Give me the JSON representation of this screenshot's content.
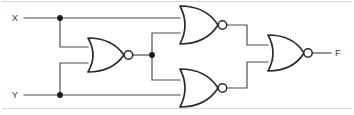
{
  "diagram": {
    "type": "logic-circuit",
    "colors": {
      "background": "#ffffff",
      "wire": "#4a4a4a",
      "gate_outline": "#2b2b2b",
      "label_text": "#3d3d3d",
      "junction": "#1a1a1a",
      "frame": "#d8d8d8"
    },
    "inputs": [
      {
        "id": "X",
        "label": "X",
        "x": 15,
        "y": 18
      },
      {
        "id": "Y",
        "label": "Y",
        "x": 15,
        "y": 95
      }
    ],
    "outputs": [
      {
        "id": "F",
        "label": "F",
        "x": 337,
        "y": 53
      }
    ],
    "gates": [
      {
        "id": "g1",
        "type": "NOR",
        "label": "NOR",
        "inputs": [
          "X",
          "Y"
        ],
        "output": "n1",
        "x": 88,
        "y": 55
      },
      {
        "id": "g2",
        "type": "NOR",
        "label": "NOR",
        "inputs": [
          "X",
          "n1"
        ],
        "output": "n2",
        "x": 180,
        "y": 22
      },
      {
        "id": "g3",
        "type": "NOR",
        "label": "NOR",
        "inputs": [
          "n1",
          "Y"
        ],
        "output": "n3",
        "x": 180,
        "y": 90
      },
      {
        "id": "g4",
        "type": "NOR",
        "label": "NOR",
        "inputs": [
          "n2",
          "n3"
        ],
        "output": "F",
        "x": 268,
        "y": 53
      }
    ],
    "junctions": [
      {
        "id": "j-x",
        "on_net": "X",
        "x": 60,
        "y": 18
      },
      {
        "id": "j-y",
        "on_net": "Y",
        "x": 60,
        "y": 95
      },
      {
        "id": "j-n1",
        "on_net": "n1",
        "x": 152,
        "y": 55
      }
    ],
    "nets": [
      {
        "id": "X",
        "from": "input-X",
        "to": [
          "g1.in1",
          "g2.in1"
        ]
      },
      {
        "id": "Y",
        "from": "input-Y",
        "to": [
          "g1.in2",
          "g3.in2"
        ]
      },
      {
        "id": "n1",
        "from": "g1.out",
        "to": [
          "g2.in2",
          "g3.in1"
        ]
      },
      {
        "id": "n2",
        "from": "g2.out",
        "to": [
          "g4.in1"
        ]
      },
      {
        "id": "n3",
        "from": "g3.out",
        "to": [
          "g4.in2"
        ]
      },
      {
        "id": "F",
        "from": "g4.out",
        "to": [
          "output-F"
        ]
      }
    ]
  }
}
